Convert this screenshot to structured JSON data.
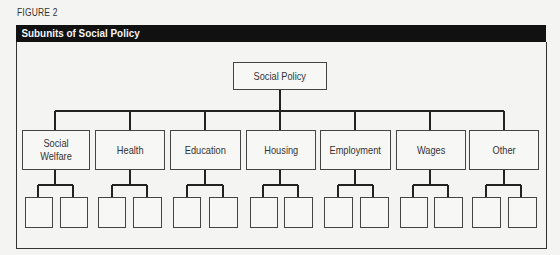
{
  "figure_label": "FIGURE 2",
  "title": "Subunits of Social Policy",
  "root": {
    "label": "Social Policy"
  },
  "subunits": [
    {
      "label": "Social\nWelfare",
      "children": 2
    },
    {
      "label": "Health",
      "children": 2
    },
    {
      "label": "Education",
      "children": 2
    },
    {
      "label": "Housing",
      "children": 2
    },
    {
      "label": "Employment",
      "children": 2
    },
    {
      "label": "Wages",
      "children": 2
    },
    {
      "label": "Other",
      "children": 2
    }
  ]
}
